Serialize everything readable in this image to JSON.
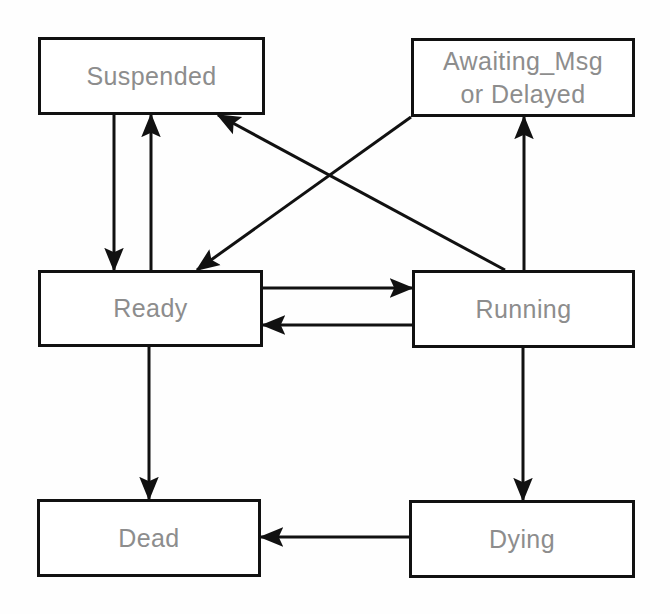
{
  "diagram": {
    "type": "state-diagram",
    "canvas": {
      "width": 670,
      "height": 614,
      "background": "#fefefe"
    },
    "style": {
      "box_stroke": "#111111",
      "box_stroke_width": 3,
      "box_fill": "#ffffff",
      "arrow_stroke": "#111111",
      "arrow_stroke_width": 3,
      "label_color": "#8d8d8d",
      "label_font_size": 25
    },
    "nodes": [
      {
        "id": "suspended",
        "label": "Suspended",
        "label_line2": "",
        "x": 38,
        "y": 37,
        "w": 227,
        "h": 78
      },
      {
        "id": "awaiting",
        "label": "Awaiting_Msg",
        "label_line2": "or Delayed",
        "x": 411,
        "y": 38,
        "w": 224,
        "h": 79
      },
      {
        "id": "ready",
        "label": "Ready",
        "label_line2": "",
        "x": 38,
        "y": 270,
        "w": 225,
        "h": 77
      },
      {
        "id": "running",
        "label": "Running",
        "label_line2": "",
        "x": 412,
        "y": 270,
        "w": 223,
        "h": 78
      },
      {
        "id": "dead",
        "label": "Dead",
        "label_line2": "",
        "x": 37,
        "y": 499,
        "w": 224,
        "h": 78
      },
      {
        "id": "dying",
        "label": "Dying",
        "label_line2": "",
        "x": 409,
        "y": 500,
        "w": 226,
        "h": 78
      }
    ],
    "edges": [
      {
        "id": "suspended-to-ready",
        "from": "suspended",
        "to": "ready",
        "kind": "vertical",
        "x1": 114,
        "y1": 115,
        "x2": 114,
        "y2": 270
      },
      {
        "id": "ready-to-suspended",
        "from": "ready",
        "to": "suspended",
        "kind": "vertical",
        "x1": 151,
        "y1": 270,
        "x2": 151,
        "y2": 115
      },
      {
        "id": "running-to-suspended",
        "from": "running",
        "to": "suspended",
        "kind": "diagonal",
        "x1": 505,
        "y1": 270,
        "x2": 218,
        "y2": 115
      },
      {
        "id": "awaiting-to-ready",
        "from": "awaiting",
        "to": "ready",
        "kind": "diagonal",
        "x1": 411,
        "y1": 117,
        "x2": 197,
        "y2": 270
      },
      {
        "id": "ready-to-running",
        "from": "ready",
        "to": "running",
        "kind": "horizontal",
        "x1": 263,
        "y1": 288,
        "x2": 412,
        "y2": 288
      },
      {
        "id": "running-to-ready",
        "from": "running",
        "to": "ready",
        "kind": "horizontal",
        "x1": 412,
        "y1": 325,
        "x2": 263,
        "y2": 325
      },
      {
        "id": "running-to-awaiting",
        "from": "running",
        "to": "awaiting",
        "kind": "vertical",
        "x1": 524,
        "y1": 270,
        "x2": 524,
        "y2": 117
      },
      {
        "id": "ready-to-dead",
        "from": "ready",
        "to": "dead",
        "kind": "vertical",
        "x1": 149,
        "y1": 347,
        "x2": 149,
        "y2": 499
      },
      {
        "id": "running-to-dying",
        "from": "running",
        "to": "dying",
        "kind": "vertical",
        "x1": 523,
        "y1": 348,
        "x2": 523,
        "y2": 500
      },
      {
        "id": "dying-to-dead",
        "from": "dying",
        "to": "dead",
        "kind": "horizontal",
        "x1": 409,
        "y1": 537,
        "x2": 261,
        "y2": 537
      }
    ]
  }
}
